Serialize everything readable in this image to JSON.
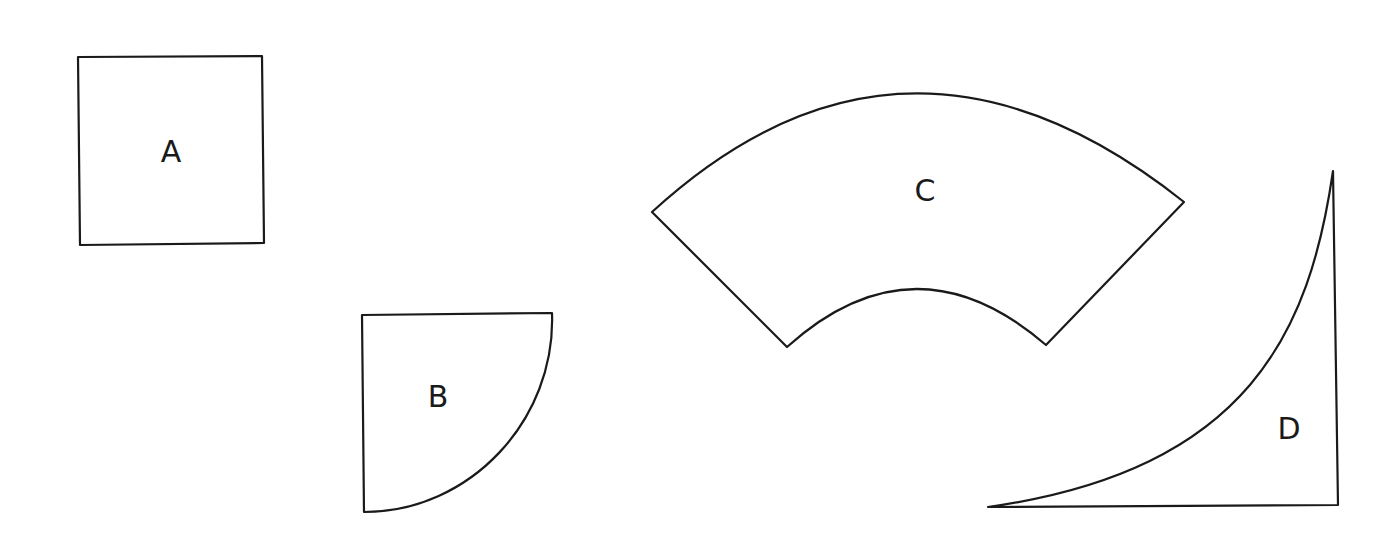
{
  "diagram": {
    "stroke_color": "#1a1a1a",
    "background": "#ffffff",
    "shapes": [
      {
        "id": "A",
        "label": "A",
        "kind": "square"
      },
      {
        "id": "B",
        "label": "B",
        "kind": "quarter-circle"
      },
      {
        "id": "C",
        "label": "C",
        "kind": "annular-sector"
      },
      {
        "id": "D",
        "label": "D",
        "kind": "concave-curved-triangle"
      }
    ]
  }
}
